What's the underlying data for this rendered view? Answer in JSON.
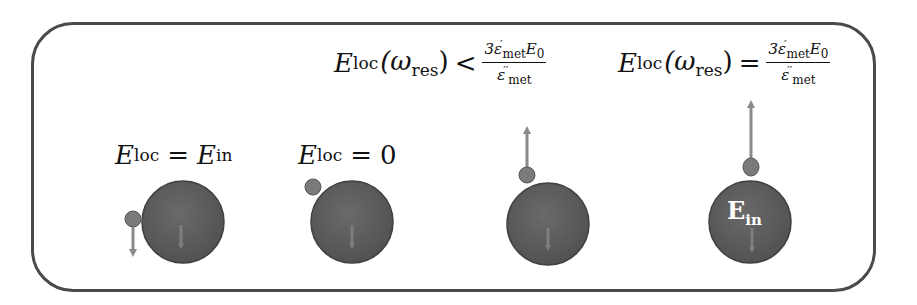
{
  "diagram": {
    "frame": {
      "stroke": "#4a4a4a",
      "shape": "rounded-rectangle"
    },
    "labels": [
      {
        "id": "case1",
        "lhs": "E",
        "lhs_sub": "loc",
        "op": "=",
        "rhs": "E",
        "rhs_sub": "in"
      },
      {
        "id": "case2",
        "lhs": "E",
        "lhs_sub": "loc",
        "op": "=",
        "rhs": "0"
      },
      {
        "id": "case3",
        "lhs": "E",
        "lhs_sub": "loc",
        "arg": "(ω",
        "arg_sub": "res",
        "arg_close": ")",
        "op": "<",
        "num_coef": "3ε",
        "num_sup": "′",
        "num_sub": "met",
        "num_e": "E",
        "num_e_sub": "0",
        "den": "ε",
        "den_sup": "′′",
        "den_sub": "met"
      },
      {
        "id": "case4",
        "lhs": "E",
        "lhs_sub": "loc",
        "arg": "(ω",
        "arg_sub": "res",
        "arg_close": ")",
        "op": "=",
        "num_coef": "3ε",
        "num_sup": "′",
        "num_sub": "met",
        "num_e": "E",
        "num_e_sub": "0",
        "den": "ε",
        "den_sup": "′′",
        "den_sub": "met"
      }
    ],
    "inner_label": {
      "main": "E",
      "sub": "in"
    },
    "colors": {
      "large_sphere": "#5a5a5a",
      "small_particle": "#7a7a7a",
      "arrow": "#8a8a8a",
      "inner_arrow": "#7e7e7e",
      "text": "#111111"
    },
    "particles": [
      {
        "case": "case1",
        "arrow": "down",
        "position": "left"
      },
      {
        "case": "case2",
        "arrow": "none",
        "position": "upper-left"
      },
      {
        "case": "case3",
        "arrow": "up-short",
        "position": "top"
      },
      {
        "case": "case4",
        "arrow": "up-long",
        "position": "top"
      }
    ]
  }
}
